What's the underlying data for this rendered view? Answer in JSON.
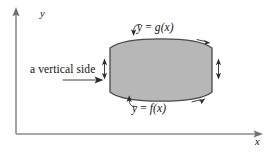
{
  "figure": {
    "kind": "calculus-region-diagram",
    "background_color": "#ffffff"
  },
  "axes": {
    "x_label": "x",
    "y_label": "y",
    "axis_color": "#8d8d8d",
    "origin": {
      "x": 16,
      "y": 134
    },
    "x_axis_end": {
      "x": 258,
      "y": 134
    },
    "y_axis_end": {
      "x": 16,
      "y": 12
    }
  },
  "region": {
    "fill_color": "#b7b7b7",
    "outline_color": "#4a4a4a",
    "left_edge_x": 110,
    "right_edge_x": 212,
    "top_apex_y": 39,
    "bottom_apex_y": 101,
    "left_edge_top_y": 48,
    "left_edge_bottom_y": 92,
    "right_edge_top_y": 48,
    "right_edge_bottom_y": 92
  },
  "labels": {
    "upper_curve": {
      "text": "y = g(x)",
      "var_y": "y",
      "equals": " = ",
      "func": "g",
      "arg": "(x)"
    },
    "lower_curve": {
      "text": "y = f(x)",
      "var_y": "y",
      "equals": " = ",
      "func": "f",
      "arg": "(x)"
    },
    "vertical_side": {
      "text": "a vertical side"
    }
  },
  "markers": {
    "left_side_indicator": "double-headed-vertical-arrow",
    "right_side_indicator": "double-headed-vertical-arrow",
    "top_curve_orientation": "arrow-right",
    "bottom_curve_orientation": "arrow-right",
    "upper_label_pointer": "hook-arrow-down",
    "lower_label_pointer": "hook-arrow-up",
    "vertical_side_pointer": "arrow-right"
  },
  "colors": {
    "region_fill": "#b7b7b7",
    "region_stroke": "#4a4a4a",
    "axis": "#8d8d8d",
    "annotation": "#2b2b2b",
    "text": "#141414"
  }
}
